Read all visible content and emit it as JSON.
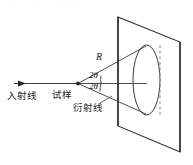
{
  "figure": {
    "labels": {
      "incident_ray": "入射线",
      "sample": "试样",
      "diffracted_ray": "衍射线",
      "radius": "R",
      "angle_upper": "2θ",
      "angle_lower": "2θ"
    },
    "colors": {
      "line": "#2b2b2b",
      "dashed": "#8a8a8a",
      "text": "#1a1a1a",
      "background": "#ffffff"
    },
    "artifacts": {
      "top_strip_text": "·· ···  ··· ···· ·· ··· ····"
    }
  }
}
